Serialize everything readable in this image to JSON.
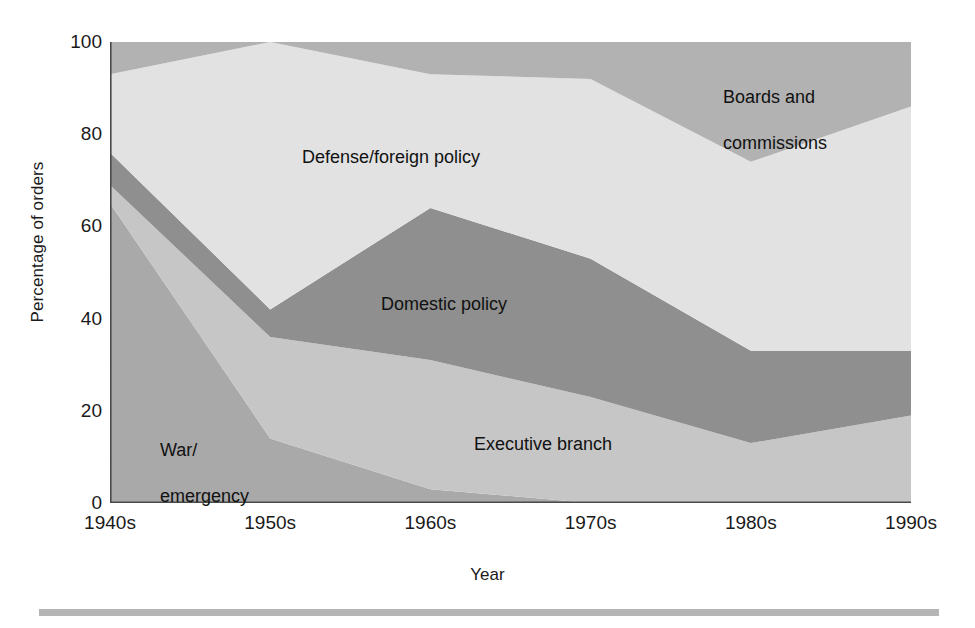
{
  "chart_data": {
    "type": "area",
    "stacked": true,
    "title": "",
    "xlabel": "Year",
    "ylabel": "Percentage of orders",
    "categories": [
      "1940s",
      "1950s",
      "1960s",
      "1970s",
      "1980s",
      "1990s"
    ],
    "ylim": [
      0,
      100
    ],
    "yticks": [
      0,
      20,
      40,
      60,
      80,
      100
    ],
    "grid": false,
    "legend_position": "inline-labels",
    "series": [
      {
        "name": "War/\nemergency",
        "label": "War/\nemergency",
        "color": "#a9a9a9",
        "values": [
          65,
          14,
          3,
          0,
          0,
          0
        ]
      },
      {
        "name": "Executive branch",
        "label": "Executive branch",
        "color": "#c6c6c6",
        "values": [
          4,
          22,
          28,
          23,
          13,
          19
        ]
      },
      {
        "name": "Domestic policy",
        "label": "Domestic policy",
        "color": "#8f8f8f",
        "values": [
          7,
          6,
          33,
          30,
          20,
          14
        ]
      },
      {
        "name": "Defense/foreign policy",
        "label": "Defense/foreign policy",
        "color": "#e2e2e2",
        "values": [
          17,
          58,
          29,
          39,
          41,
          53
        ]
      },
      {
        "name": "Boards and\ncommissions",
        "label": "Boards and\ncommissions",
        "color": "#b2b2b2",
        "values": [
          7,
          0,
          7,
          8,
          26,
          14
        ]
      }
    ],
    "cumulative_tops": {
      "war_emergency": [
        65,
        14,
        3,
        0,
        0,
        0
      ],
      "executive_branch": [
        69,
        36,
        31,
        23,
        13,
        19
      ],
      "domestic_policy": [
        76,
        42,
        64,
        53,
        33,
        33
      ],
      "defense_foreign": [
        93,
        100,
        93,
        92,
        74,
        86
      ],
      "boards": [
        100,
        100,
        100,
        100,
        100,
        100
      ]
    }
  },
  "axes": {
    "y_title": "Percentage of orders",
    "x_title": "Year",
    "y_tick_labels": [
      "0",
      "20",
      "40",
      "60",
      "80",
      "100"
    ],
    "x_tick_labels": [
      "1940s",
      "1950s",
      "1960s",
      "1970s",
      "1980s",
      "1990s"
    ]
  },
  "labels": {
    "boards_line1": "Boards and",
    "boards_line2": "commissions",
    "defense": "Defense/foreign policy",
    "domestic": "Domestic policy",
    "executive": "Executive branch",
    "war_line1": "War/",
    "war_line2": "emergency"
  },
  "colors": {
    "war_emergency": "#a9a9a9",
    "executive_branch": "#c6c6c6",
    "domestic_policy": "#8f8f8f",
    "defense_foreign": "#e2e2e2",
    "boards_commissions": "#b2b2b2",
    "axis": "#4a4a4a",
    "rule": "#b5b5b5",
    "text": "#111111"
  }
}
